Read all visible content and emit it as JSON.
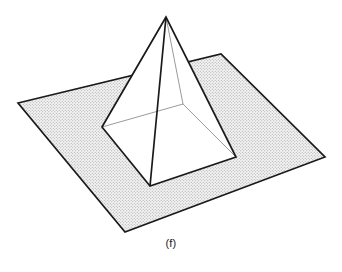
{
  "figure": {
    "caption": "(f)",
    "kind": "line-drawing",
    "background_color": "#ffffff",
    "stroke_color": "#1a1a1a",
    "hidden_stroke_color": "#555555",
    "plane_fill_color": "#f2f2f2",
    "plane_dot_color": "#a8a8a8",
    "solid_fill_color": "#ffffff",
    "visible_stroke_width": 1.7,
    "hidden_stroke_width": 0.6,
    "ground_plane": {
      "name": "ground-plane",
      "points": "18,103 221,54 325,157 125,232",
      "corners": [
        {
          "label": "left",
          "x": 18,
          "y": 103
        },
        {
          "label": "top",
          "x": 221,
          "y": 54
        },
        {
          "label": "right",
          "x": 325,
          "y": 157
        },
        {
          "label": "bottom",
          "x": 125,
          "y": 232
        }
      ]
    },
    "pyramid": {
      "name": "square-pyramid",
      "apex": {
        "label": "apex",
        "x": 166,
        "y": 17
      },
      "base": [
        {
          "label": "base-left",
          "x": 102,
          "y": 127
        },
        {
          "label": "base-back",
          "x": 183,
          "y": 104
        },
        {
          "label": "base-right",
          "x": 236,
          "y": 157
        },
        {
          "label": "base-front",
          "x": 150,
          "y": 186
        }
      ],
      "face_left": "166,17 102,127 150,186",
      "face_right": "166,17 150,186 236,157",
      "visible_outline": "166,17 102,127 150,186 236,157",
      "hidden_edges": [
        {
          "name": "hidden-edge-apex-back",
          "x1": 166,
          "y1": 17,
          "x2": 183,
          "y2": 104
        },
        {
          "name": "hidden-edge-left-back",
          "x1": 102,
          "y1": 127,
          "x2": 183,
          "y2": 104
        },
        {
          "name": "hidden-edge-right-back",
          "x1": 236,
          "y1": 157,
          "x2": 183,
          "y2": 104
        }
      ]
    }
  }
}
